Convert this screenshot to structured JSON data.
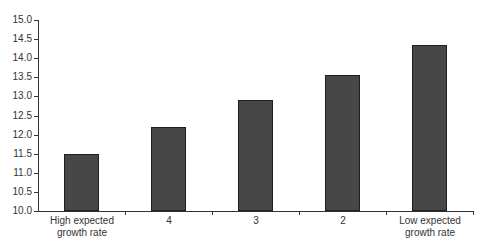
{
  "chart_data": {
    "type": "bar",
    "title": "",
    "xlabel": "",
    "ylabel": "",
    "categories": [
      "High expected growth rate",
      "4",
      "3",
      "2",
      "Low expected growth rate"
    ],
    "category_lines": [
      [
        "High expected",
        "growth rate"
      ],
      [
        "4"
      ],
      [
        "3"
      ],
      [
        "2"
      ],
      [
        "Low expected",
        "growth rate"
      ]
    ],
    "values": [
      11.5,
      12.2,
      12.9,
      13.55,
      14.35
    ],
    "ylim": [
      10.0,
      15.0
    ],
    "yticks": [
      "10.0",
      "10.5",
      "11.0",
      "11.5",
      "12.0",
      "12.5",
      "13.0",
      "13.5",
      "14.0",
      "14.5",
      "15.0"
    ],
    "grid": false,
    "legend": null,
    "bar_color": "#474747",
    "bar_edge_color": "#1f1f1f"
  }
}
